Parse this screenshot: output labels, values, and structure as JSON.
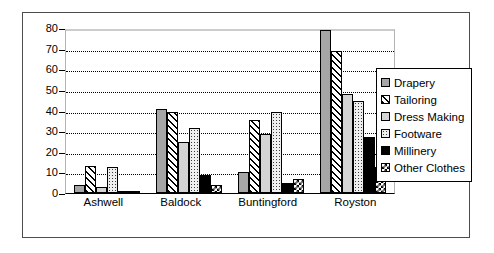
{
  "chart_data": {
    "type": "bar",
    "title": "",
    "xlabel": "",
    "ylabel": "",
    "ylim": [
      0,
      80
    ],
    "yticks": [
      0,
      10,
      20,
      30,
      40,
      50,
      60,
      70,
      80
    ],
    "grid": true,
    "legend_position": "right",
    "categories": [
      "Ashwell",
      "Baldock",
      "Buntingford",
      "Royston"
    ],
    "series": [
      {
        "name": "Drapery",
        "values": [
          4,
          40.5,
          10,
          79
        ]
      },
      {
        "name": "Tailoring",
        "values": [
          13,
          39.5,
          35.5,
          69
        ]
      },
      {
        "name": "Dress Making",
        "values": [
          3,
          24.5,
          28.5,
          48
        ]
      },
      {
        "name": "Footware",
        "values": [
          12.5,
          31.5,
          39.5,
          44.5
        ]
      },
      {
        "name": "Millinery",
        "values": [
          0.5,
          8.5,
          5,
          27
        ]
      },
      {
        "name": "Other Clothes",
        "values": [
          0.5,
          4,
          7,
          12.5
        ]
      }
    ]
  },
  "legend": {
    "items": [
      {
        "label": "Drapery",
        "swatch": "solid-grey"
      },
      {
        "label": "Tailoring",
        "swatch": "diagonal-hatch"
      },
      {
        "label": "Dress Making",
        "swatch": "light-grey"
      },
      {
        "label": "Footware",
        "swatch": "dotted"
      },
      {
        "label": "Millinery",
        "swatch": "solid-black"
      },
      {
        "label": "Other Clothes",
        "swatch": "checkerboard"
      }
    ]
  },
  "axis": {
    "y_labels": [
      "80",
      "70",
      "60",
      "50",
      "40",
      "30",
      "20",
      "10",
      "0"
    ]
  }
}
